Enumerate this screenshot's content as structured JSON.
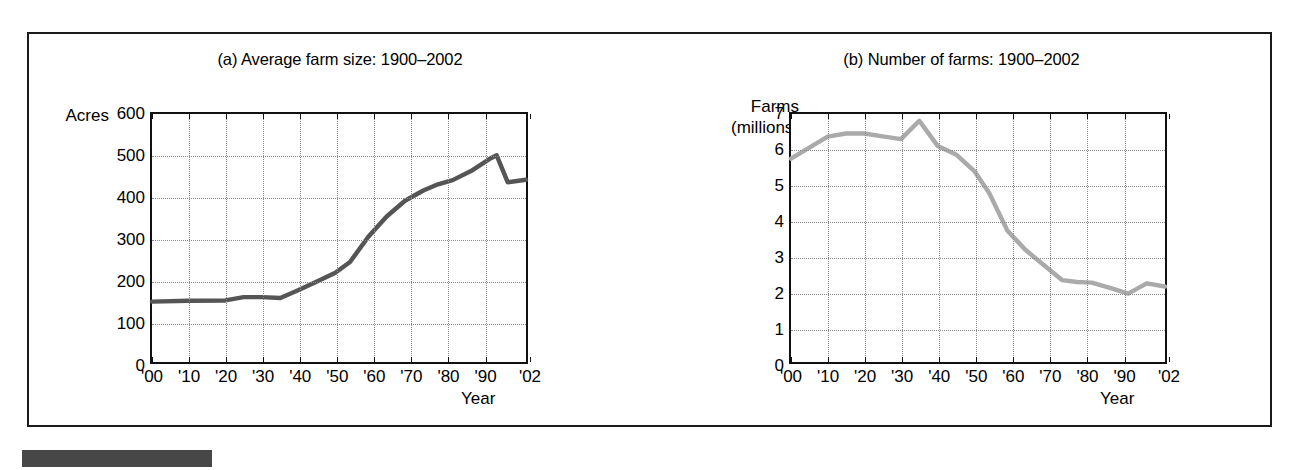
{
  "figure": {
    "source_bar_color": "#474747"
  },
  "panels": [
    {
      "id": "a",
      "title": "(a) Average farm size: 1900–2002",
      "ylabel_lines": [
        "Acres"
      ],
      "xlabel": "Year",
      "line_color": "#555555"
    },
    {
      "id": "b",
      "title": "(b) Number of farms: 1900–2002",
      "ylabel_lines": [
        "Farms",
        "(millions)"
      ],
      "xlabel": "Year",
      "line_color": "#aaaaaa"
    }
  ],
  "chart_data": [
    {
      "type": "line",
      "title": "(a) Average farm size: 1900–2002",
      "xlabel": "Year",
      "ylabel": "Acres",
      "xlim": [
        1900,
        2002
      ],
      "ylim": [
        0,
        600
      ],
      "grid": true,
      "legend": "none",
      "line_color": "#555555",
      "xticks": [
        1900,
        1910,
        1920,
        1930,
        1940,
        1950,
        1960,
        1970,
        1980,
        1990,
        2002
      ],
      "xticklabels": [
        "'00",
        "'10",
        "'20",
        "'30",
        "'40",
        "'50",
        "'60",
        "'70",
        "'80",
        "'90",
        "'02"
      ],
      "yticks": [
        0,
        100,
        200,
        300,
        400,
        500,
        600
      ],
      "yticklabels": [
        "0",
        "100",
        "200",
        "300",
        "400",
        "500",
        "600"
      ],
      "x": [
        1900,
        1910,
        1920,
        1925,
        1930,
        1935,
        1940,
        1945,
        1950,
        1954,
        1959,
        1964,
        1969,
        1974,
        1978,
        1982,
        1987,
        1992,
        1994,
        1997,
        2002
      ],
      "values": [
        146,
        148,
        149,
        157,
        157,
        155,
        174,
        195,
        216,
        242,
        303,
        352,
        390,
        415,
        430,
        440,
        462,
        491,
        500,
        435,
        441
      ]
    },
    {
      "type": "line",
      "title": "(b) Number of farms: 1900–2002",
      "xlabel": "Year",
      "ylabel": "Farms (millions)",
      "xlim": [
        1900,
        2002
      ],
      "ylim": [
        0,
        7
      ],
      "grid": true,
      "legend": "none",
      "line_color": "#aaaaaa",
      "xticks": [
        1900,
        1910,
        1920,
        1930,
        1940,
        1950,
        1960,
        1970,
        1980,
        1990,
        2002
      ],
      "xticklabels": [
        "'00",
        "'10",
        "'20",
        "'30",
        "'40",
        "'50",
        "'60",
        "'70",
        "'80",
        "'90",
        "'02"
      ],
      "yticks": [
        0,
        1,
        2,
        3,
        4,
        5,
        6,
        7
      ],
      "yticklabels": [
        "0",
        "1",
        "2",
        "3",
        "4",
        "5",
        "6",
        "7"
      ],
      "x": [
        1900,
        1910,
        1915,
        1920,
        1925,
        1930,
        1935,
        1940,
        1945,
        1950,
        1954,
        1959,
        1964,
        1969,
        1974,
        1978,
        1982,
        1987,
        1992,
        1997,
        2002
      ],
      "values": [
        5.74,
        6.36,
        6.45,
        6.45,
        6.37,
        6.29,
        6.81,
        6.1,
        5.86,
        5.39,
        4.78,
        3.71,
        3.16,
        2.73,
        2.31,
        2.26,
        2.24,
        2.09,
        1.93,
        2.22,
        2.13
      ]
    }
  ]
}
